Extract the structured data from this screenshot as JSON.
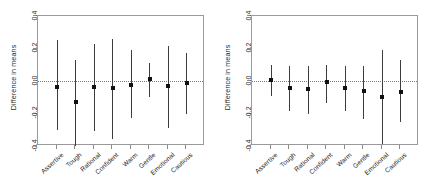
{
  "figure": {
    "background": "#ffffff",
    "point_color": "#111111",
    "whisker_color": "#3d3d3d",
    "frame_color": "#9a9a9a",
    "zero_line_color": "#7a7a7a"
  },
  "chart_data": [
    {
      "type": "scatter",
      "panel": "left",
      "title": "",
      "xlabel": "",
      "ylabel": "Difference in means",
      "ylim": [
        -0.4,
        0.4
      ],
      "ytick_labels": [
        "0.4",
        "0.2",
        "0.0",
        "-0.2",
        "-0.4"
      ],
      "ytick_values": [
        0.4,
        0.2,
        0.0,
        -0.2,
        -0.4
      ],
      "grid": false,
      "legend": "none",
      "reference_line": 0.0,
      "categories": [
        "Assertive",
        "Tough",
        "Rational",
        "Confident",
        "Warm",
        "Gentle",
        "Emotional",
        "Cautious"
      ],
      "values": [
        -0.035,
        -0.13,
        -0.035,
        -0.04,
        -0.025,
        0.01,
        -0.03,
        -0.01
      ],
      "ci_lower": [
        -0.3,
        -0.4,
        -0.31,
        -0.355,
        -0.23,
        -0.1,
        -0.29,
        -0.2
      ],
      "ci_upper": [
        0.25,
        0.13,
        0.23,
        0.26,
        0.19,
        0.11,
        0.215,
        0.175
      ]
    },
    {
      "type": "scatter",
      "panel": "right",
      "title": "",
      "xlabel": "",
      "ylabel": "Difference in means",
      "ylim": [
        -0.4,
        0.4
      ],
      "ytick_labels": [
        "0.4",
        "0.2",
        "0.0",
        "-0.2",
        "-0.4"
      ],
      "ytick_values": [
        0.4,
        0.2,
        0.0,
        -0.2,
        -0.4
      ],
      "grid": false,
      "legend": "none",
      "reference_line": 0.0,
      "categories": [
        "Assertive",
        "Tough",
        "Rational",
        "Confident",
        "Warm",
        "Gentle",
        "Emotional",
        "Cautious"
      ],
      "values": [
        0.005,
        -0.045,
        -0.05,
        -0.005,
        -0.045,
        -0.06,
        -0.1,
        -0.065
      ],
      "ci_lower": [
        -0.09,
        -0.185,
        -0.2,
        -0.135,
        -0.185,
        -0.235,
        -0.385,
        -0.255
      ],
      "ci_upper": [
        0.1,
        0.09,
        0.09,
        0.1,
        0.095,
        0.095,
        0.19,
        0.13
      ]
    }
  ]
}
